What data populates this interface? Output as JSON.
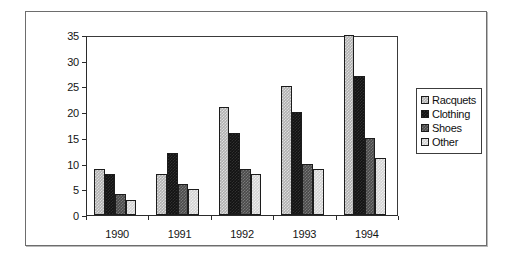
{
  "chart_data": {
    "type": "bar",
    "title": "",
    "subtitle": "",
    "xlabel": "",
    "ylabel": "",
    "categories": [
      "1990",
      "1991",
      "1992",
      "1993",
      "1994"
    ],
    "series": [
      {
        "name": "Racquets",
        "color": "#b0b0b0",
        "values": [
          9,
          8,
          21,
          25,
          35
        ]
      },
      {
        "name": "Clothing",
        "color": "#121212",
        "values": [
          8,
          12,
          16,
          20,
          27
        ]
      },
      {
        "name": "Shoes",
        "color": "#4a4a4a",
        "values": [
          4,
          6,
          9,
          10,
          15
        ]
      },
      {
        "name": "Other",
        "color": "#d2d2d2",
        "values": [
          3,
          5,
          8,
          9,
          11
        ]
      }
    ],
    "ylim": [
      0,
      35
    ],
    "yticks": [
      0,
      5,
      10,
      15,
      20,
      25,
      30,
      35
    ],
    "ytick_labels": [
      "0",
      "5",
      "10",
      "15",
      "20",
      "25",
      "30",
      "35"
    ],
    "grid": false,
    "legend_position": "right"
  },
  "legend": {
    "entries": [
      {
        "label": "Racquets"
      },
      {
        "label": "Clothing"
      },
      {
        "label": "Shoes"
      },
      {
        "label": "Other"
      }
    ]
  }
}
